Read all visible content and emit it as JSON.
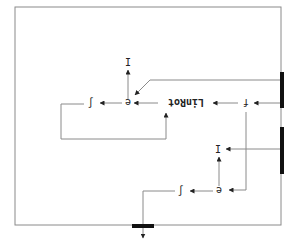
{
  "diagram": {
    "orientation": "rotated 180 degrees",
    "colors": {
      "line": "#8a8a8a",
      "bar": "#111111",
      "text": "#222222",
      "background": "#ffffff"
    },
    "nodes": {
      "linrot": "LinRot",
      "f": "f",
      "e_top": "e",
      "e_bottom": "e",
      "i_top": "I",
      "i_bottom": "I",
      "integral_top": "∫",
      "integral_bottom": "∫"
    }
  }
}
